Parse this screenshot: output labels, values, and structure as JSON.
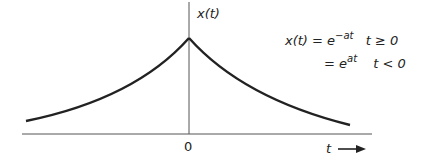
{
  "diagram": {
    "y_axis_label": "x(t)",
    "origin_label": "0",
    "x_axis_label": "t",
    "x_axis_arrow": "→",
    "equation": {
      "line1_lhs": "x(t) = e",
      "line1_exp": "−at",
      "line1_cond": "t ≥ 0",
      "line2_lhs": "= e",
      "line2_exp": "at",
      "line2_cond": "t < 0"
    },
    "curve": {
      "description": "two-sided exponential decay, peak at t = 0",
      "color": "#222222"
    }
  }
}
